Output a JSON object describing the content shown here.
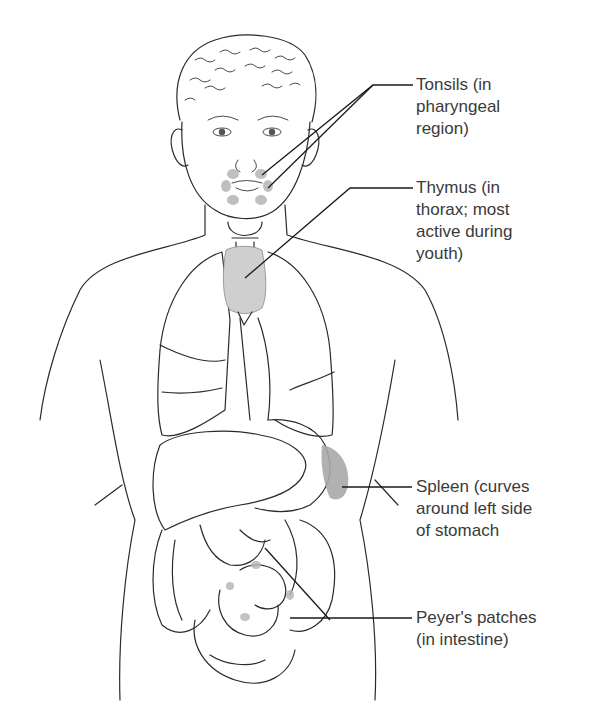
{
  "figure": {
    "highlight_color": "#9a9a9a",
    "line_color": "#2a2a2a"
  },
  "labels": [
    {
      "id": "tonsils",
      "text": "Tonsils (in\npharyngeal\nregion)"
    },
    {
      "id": "thymus",
      "text": "Thymus (in\nthorax; most\nactive during\nyouth)"
    },
    {
      "id": "spleen",
      "text": "Spleen (curves\naround left side\nof stomach"
    },
    {
      "id": "peyers",
      "text": "Peyer's patches\n(in intestine)"
    }
  ]
}
